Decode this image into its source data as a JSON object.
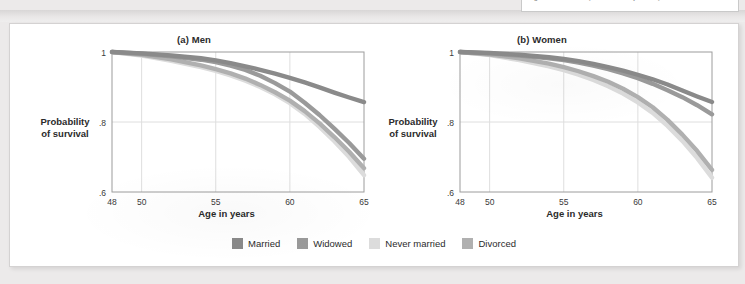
{
  "clipped_text": {
    "text": "if god let him live! (Ehara & Nanji, 1111.)"
  },
  "figure": {
    "panels": [
      {
        "id": "men",
        "title": "(a) Men",
        "y_axis_title": "Probability\nof survival",
        "x_axis_title": "Age in years"
      },
      {
        "id": "women",
        "title": "(b) Women",
        "y_axis_title": "Probability\nof survival",
        "x_axis_title": "Age in years"
      }
    ],
    "legend": [
      {
        "label": "Married",
        "color": "#8a8a8a"
      },
      {
        "label": "Widowed",
        "color": "#9a9a9a"
      },
      {
        "label": "Never married",
        "color": "#dcdcdc"
      },
      {
        "label": "Divorced",
        "color": "#b0b0b0"
      }
    ]
  },
  "chart_data": [
    {
      "type": "line",
      "title": "(a) Men",
      "xlabel": "Age in years",
      "ylabel": "Probability of survival",
      "xlim": [
        48,
        65
      ],
      "ylim": [
        0.6,
        1.0
      ],
      "xticks": [
        48,
        50,
        55,
        60,
        65
      ],
      "xtick_labels": [
        "48",
        "50",
        "55",
        "60",
        "65"
      ],
      "yticks": [
        0.6,
        0.8,
        1.0
      ],
      "ytick_labels": [
        ".6",
        ".8",
        "1"
      ],
      "grid": true,
      "legend_position": "bottom",
      "x": [
        48,
        50,
        52,
        54,
        55,
        56,
        57,
        58,
        59,
        60,
        61,
        62,
        63,
        64,
        65
      ],
      "series": [
        {
          "name": "Married",
          "color": "#8a8a8a",
          "values": [
            1.0,
            0.996,
            0.99,
            0.982,
            0.976,
            0.968,
            0.959,
            0.949,
            0.938,
            0.926,
            0.913,
            0.899,
            0.884,
            0.87,
            0.857
          ]
        },
        {
          "name": "Widowed",
          "color": "#9a9a9a",
          "values": [
            1.0,
            0.995,
            0.988,
            0.978,
            0.971,
            0.961,
            0.949,
            0.932,
            0.911,
            0.887,
            0.855,
            0.82,
            0.781,
            0.74,
            0.695
          ]
        },
        {
          "name": "Never married",
          "color": "#dcdcdc",
          "values": [
            1.0,
            0.99,
            0.975,
            0.957,
            0.946,
            0.933,
            0.918,
            0.9,
            0.879,
            0.854,
            0.823,
            0.786,
            0.745,
            0.7,
            0.648
          ]
        },
        {
          "name": "Divorced",
          "color": "#b0b0b0",
          "values": [
            1.0,
            0.992,
            0.979,
            0.962,
            0.951,
            0.939,
            0.924,
            0.906,
            0.885,
            0.861,
            0.831,
            0.796,
            0.757,
            0.715,
            0.668
          ]
        }
      ]
    },
    {
      "type": "line",
      "title": "(b) Women",
      "xlabel": "Age in years",
      "ylabel": "Probability of survival",
      "xlim": [
        48,
        65
      ],
      "ylim": [
        0.6,
        1.0
      ],
      "xticks": [
        48,
        50,
        55,
        60,
        65
      ],
      "xtick_labels": [
        "48",
        "50",
        "55",
        "60",
        "65"
      ],
      "yticks": [
        0.6,
        0.8,
        1.0
      ],
      "ytick_labels": [
        ".6",
        ".8",
        "1"
      ],
      "grid": true,
      "legend_position": "bottom",
      "x": [
        48,
        50,
        52,
        54,
        55,
        56,
        57,
        58,
        59,
        60,
        61,
        62,
        63,
        64,
        65
      ],
      "series": [
        {
          "name": "Married",
          "color": "#8a8a8a",
          "values": [
            1.0,
            0.997,
            0.992,
            0.985,
            0.98,
            0.974,
            0.966,
            0.957,
            0.947,
            0.935,
            0.922,
            0.907,
            0.89,
            0.873,
            0.857
          ]
        },
        {
          "name": "Widowed",
          "color": "#9a9a9a",
          "values": [
            1.0,
            0.996,
            0.99,
            0.982,
            0.977,
            0.97,
            0.961,
            0.951,
            0.939,
            0.925,
            0.909,
            0.891,
            0.871,
            0.848,
            0.822
          ]
        },
        {
          "name": "Never married",
          "color": "#dcdcdc",
          "values": [
            1.0,
            0.991,
            0.977,
            0.959,
            0.948,
            0.935,
            0.92,
            0.902,
            0.881,
            0.856,
            0.826,
            0.789,
            0.746,
            0.697,
            0.641
          ]
        },
        {
          "name": "Divorced",
          "color": "#b0b0b0",
          "values": [
            1.0,
            0.993,
            0.982,
            0.967,
            0.957,
            0.945,
            0.931,
            0.915,
            0.895,
            0.871,
            0.842,
            0.806,
            0.764,
            0.717,
            0.663
          ]
        }
      ]
    }
  ]
}
